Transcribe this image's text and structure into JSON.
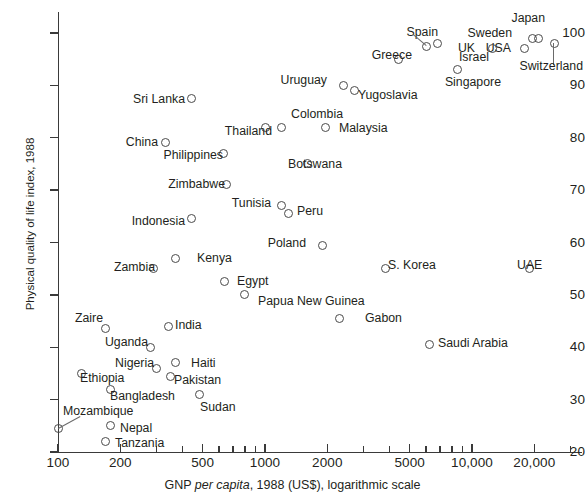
{
  "chart_data": {
    "type": "scatter",
    "title": "",
    "xlabel": "GNP per capita, 1988 (US$), logarithmic scale",
    "xlabel_parts": {
      "pre": "GNP ",
      "italic": "per capita",
      "post": ", 1988 (US$), logarithmic scale"
    },
    "ylabel": "Physical quality of life index, 1988",
    "xscale": "log",
    "xlim": [
      100,
      30000
    ],
    "ylim": [
      20,
      104
    ],
    "yticks": [
      20,
      30,
      40,
      50,
      60,
      70,
      80,
      90,
      100
    ],
    "ytick_labels": [
      "20",
      "30",
      "40",
      "50",
      "60",
      "70",
      "80",
      "90",
      "100"
    ],
    "xticks": [
      100,
      200,
      500,
      1000,
      2000,
      5000,
      10000,
      20000
    ],
    "xtick_labels": [
      "100",
      "200",
      "500",
      "1000",
      "2000",
      "5000",
      "10,000",
      "20,000"
    ],
    "xticks_minor": [
      300,
      400,
      600,
      700,
      800,
      900,
      3000,
      4000,
      6000,
      7000,
      8000,
      9000,
      30000
    ],
    "grid": false,
    "legend": false,
    "marker": "open-circle",
    "marker_color": "#4a4a4a",
    "points": [
      {
        "label": "Japan",
        "x": 21000,
        "y": 99,
        "lx": 545,
        "ly": 18,
        "anchor": "r"
      },
      {
        "label": "Sweden",
        "x": 19500,
        "y": 99,
        "lx": 512,
        "ly": 33,
        "anchor": "r"
      },
      {
        "label": "Switzerland",
        "x": 25000,
        "y": 98,
        "lx": 583,
        "ly": 66,
        "anchor": "r",
        "leader": {
          "dx": 0,
          "dy": 22
        }
      },
      {
        "label": "USA",
        "x": 18000,
        "y": 97,
        "lx": 511,
        "ly": 48,
        "anchor": "r"
      },
      {
        "label": "UK",
        "x": 12500,
        "y": 97,
        "lx": 475,
        "ly": 48,
        "anchor": "r"
      },
      {
        "label": "Spain",
        "x": 6800,
        "y": 98,
        "lx": 438,
        "ly": 32,
        "anchor": "r"
      },
      {
        "label": "Israel",
        "x": 6000,
        "y": 97.5,
        "lx": 489,
        "ly": 57,
        "anchor": "r",
        "leader": {
          "dx": -13,
          "dy": -11
        }
      },
      {
        "label": "Greece",
        "x": 4400,
        "y": 95,
        "lx": 412,
        "ly": 55,
        "anchor": "r"
      },
      {
        "label": "Singapore",
        "x": 8500,
        "y": 93,
        "lx": 501,
        "ly": 82,
        "anchor": "r"
      },
      {
        "label": "Uruguay",
        "x": 2400,
        "y": 90,
        "lx": 327,
        "ly": 80,
        "anchor": "r"
      },
      {
        "label": "Yugoslavia",
        "x": 2700,
        "y": 89,
        "lx": 358,
        "ly": 95,
        "anchor": "l"
      },
      {
        "label": "Sri Lanka",
        "x": 440,
        "y": 87.5,
        "lx": 185,
        "ly": 99,
        "anchor": "r"
      },
      {
        "label": "Colombia",
        "x": 1200,
        "y": 82,
        "lx": 317,
        "ly": 114,
        "anchor": "c"
      },
      {
        "label": "Malaysia",
        "x": 1950,
        "y": 82,
        "lx": 339,
        "ly": 128,
        "anchor": "l"
      },
      {
        "label": "Thailand",
        "x": 1000,
        "y": 82,
        "lx": 272,
        "ly": 131,
        "anchor": "r"
      },
      {
        "label": "China",
        "x": 330,
        "y": 79,
        "lx": 158,
        "ly": 142,
        "anchor": "r"
      },
      {
        "label": "Philippines",
        "x": 630,
        "y": 77,
        "lx": 223,
        "ly": 155,
        "anchor": "r"
      },
      {
        "label": "Botswana",
        "x": 1600,
        "y": 75,
        "lx": 288,
        "ly": 164,
        "anchor": "l"
      },
      {
        "label": "Zimbabwe",
        "x": 650,
        "y": 71,
        "lx": 225,
        "ly": 184,
        "anchor": "r"
      },
      {
        "label": "Tunisia",
        "x": 1200,
        "y": 67,
        "lx": 271,
        "ly": 203,
        "anchor": "r"
      },
      {
        "label": "Peru",
        "x": 1300,
        "y": 65.5,
        "lx": 297,
        "ly": 211,
        "anchor": "l"
      },
      {
        "label": "Indonesia",
        "x": 440,
        "y": 64.5,
        "lx": 185,
        "ly": 221,
        "anchor": "r"
      },
      {
        "label": "Poland",
        "x": 1900,
        "y": 59.5,
        "lx": 306,
        "ly": 243,
        "anchor": "r"
      },
      {
        "label": "Kenya",
        "x": 370,
        "y": 57,
        "lx": 197,
        "ly": 258,
        "anchor": "l"
      },
      {
        "label": "S. Korea",
        "x": 3800,
        "y": 55,
        "lx": 388,
        "ly": 265,
        "anchor": "l"
      },
      {
        "label": "UAE",
        "x": 19000,
        "y": 55,
        "lx": 517,
        "ly": 265,
        "anchor": "l"
      },
      {
        "label": "Zambia",
        "x": 290,
        "y": 55,
        "lx": 155,
        "ly": 267,
        "anchor": "r"
      },
      {
        "label": "Egypt",
        "x": 640,
        "y": 52.5,
        "lx": 237,
        "ly": 281,
        "anchor": "l"
      },
      {
        "label": "Papua New Guinea",
        "x": 800,
        "y": 50,
        "lx": 258,
        "ly": 301,
        "anchor": "l"
      },
      {
        "label": "Gabon",
        "x": 2300,
        "y": 45.5,
        "lx": 365,
        "ly": 318,
        "anchor": "l"
      },
      {
        "label": "India",
        "x": 340,
        "y": 44,
        "lx": 175,
        "ly": 325,
        "anchor": "l"
      },
      {
        "label": "Zaire",
        "x": 170,
        "y": 43.5,
        "lx": 103,
        "ly": 318,
        "anchor": "r"
      },
      {
        "label": "Saudi Arabia",
        "x": 6200,
        "y": 40.5,
        "lx": 438,
        "ly": 343,
        "anchor": "l"
      },
      {
        "label": "Uganda",
        "x": 280,
        "y": 40,
        "lx": 148,
        "ly": 342,
        "anchor": "r"
      },
      {
        "label": "Haiti",
        "x": 370,
        "y": 37,
        "lx": 191,
        "ly": 363,
        "anchor": "l"
      },
      {
        "label": "Nigeria",
        "x": 300,
        "y": 36,
        "lx": 154,
        "ly": 363,
        "anchor": "r"
      },
      {
        "label": "Pakistan",
        "x": 350,
        "y": 34.5,
        "lx": 174,
        "ly": 380,
        "anchor": "l"
      },
      {
        "label": "Ethiopia",
        "x": 130,
        "y": 35,
        "lx": 80,
        "ly": 378,
        "anchor": "l"
      },
      {
        "label": "Bangladesh",
        "x": 180,
        "y": 32,
        "lx": 110,
        "ly": 396,
        "anchor": "l"
      },
      {
        "label": "Sudan",
        "x": 480,
        "y": 31,
        "lx": 200,
        "ly": 407,
        "anchor": "l"
      },
      {
        "label": "Mozambique",
        "x": 100,
        "y": 24.5,
        "lx": 63,
        "ly": 411,
        "anchor": "l",
        "leader": {
          "dx": 22,
          "dy": -12
        }
      },
      {
        "label": "Nepal",
        "x": 180,
        "y": 25,
        "lx": 120,
        "ly": 428,
        "anchor": "l"
      },
      {
        "label": "Tanzania",
        "x": 170,
        "y": 22,
        "lx": 115,
        "ly": 443,
        "anchor": "l"
      }
    ]
  }
}
